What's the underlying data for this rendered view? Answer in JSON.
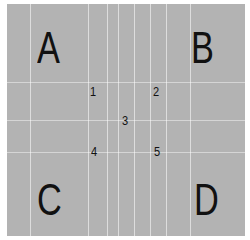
{
  "panel": {
    "background": "#b3b3b3",
    "corners": {
      "top_left": "A",
      "top_right": "B",
      "bottom_left": "C",
      "bottom_right": "D"
    },
    "numbers": [
      "1",
      "2",
      "3",
      "4",
      "5"
    ]
  }
}
